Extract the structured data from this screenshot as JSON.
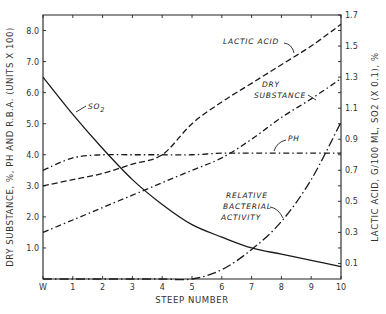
{
  "chart_data": {
    "type": "line",
    "title": "",
    "xlabel": "STEEP NUMBER",
    "ylabel": "DRY SUBSTANCE, %, PH AND R.B.A. (UNITS X 100)",
    "ylabel_right": "LACTIC ACID, G/100 ML, SO2 (X 0.1), %",
    "categories": [
      "W",
      "1",
      "2",
      "3",
      "4",
      "5",
      "6",
      "7",
      "8",
      "9",
      "10"
    ],
    "x": [
      0,
      1,
      2,
      3,
      4,
      5,
      6,
      7,
      8,
      9,
      10
    ],
    "ylim": [
      0,
      8.5
    ],
    "ylim_right": [
      0,
      1.7
    ],
    "yticks": [
      "1.0",
      "2.0",
      "3.0",
      "4.0",
      "5.0",
      "6.0",
      "7.0",
      "8.0"
    ],
    "yticks_right": [
      "0.1",
      "0.3",
      "0.5",
      "0.7",
      "0.9",
      "1.1",
      "1.3",
      "1.5",
      "1.7"
    ],
    "grid": false,
    "legend": "inline labels",
    "series": [
      {
        "name": "SO2",
        "label": "SO 2",
        "style": "solid",
        "axis": "right",
        "values": [
          6.5,
          5.3,
          4.2,
          3.2,
          2.4,
          1.75,
          1.35,
          1.0,
          0.8,
          0.6,
          0.4
        ]
      },
      {
        "name": "Lactic Acid",
        "label": "LACTIC ACID",
        "style": "dashed",
        "axis": "right",
        "values": [
          3.0,
          3.2,
          3.4,
          3.7,
          4.0,
          5.0,
          5.7,
          6.3,
          6.9,
          7.5,
          8.2
        ]
      },
      {
        "name": "Dry Substance",
        "label": "DRY SUBSTANCE",
        "style": "dash-dot",
        "axis": "left",
        "values": [
          1.5,
          1.9,
          2.3,
          2.7,
          3.1,
          3.5,
          3.9,
          4.5,
          5.2,
          5.8,
          6.45
        ]
      },
      {
        "name": "pH",
        "label": "PH",
        "style": "dash-dot",
        "axis": "left",
        "values": [
          3.5,
          3.9,
          4.0,
          4.0,
          4.0,
          4.0,
          4.05,
          4.05,
          4.05,
          4.05,
          4.05
        ]
      },
      {
        "name": "Relative Bacterial Activity",
        "label": "RELATIVE BACTERIAL ACTIVITY",
        "style": "long-dash-dot",
        "axis": "left",
        "values": [
          0,
          0,
          0,
          0,
          0,
          0,
          0.3,
          0.95,
          1.85,
          3.2,
          5.05
        ]
      }
    ]
  },
  "labels": {
    "so2": "SO",
    "so2_sub": "2",
    "lactic": "LACTIC ACID",
    "dry1": "DRY",
    "dry2": "SUBSTANCE",
    "ph": "PH",
    "rba1": "RELATIVE",
    "rba2": "BACTERIAL",
    "rba3": "ACTIVITY"
  }
}
